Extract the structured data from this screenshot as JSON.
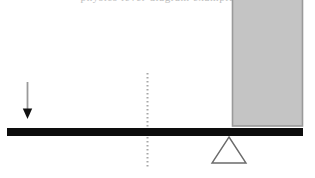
{
  "figure": {
    "background_color": "#ffffff",
    "width": 315,
    "height": 178,
    "clipped_caption_text": "physics lever diagram example"
  },
  "elements": {
    "load_block": {
      "name": "Load block",
      "fill_color": "#c4c4c4",
      "stroke_color": "#9a9a9a",
      "x": 232,
      "y": 0,
      "width": 71,
      "height": 126
    },
    "lever_beam": {
      "name": "Lever beam",
      "color": "#0d0d0d",
      "x": 7,
      "y": 128,
      "width": 296,
      "height": 8
    },
    "fulcrum": {
      "name": "Fulcrum",
      "stroke_color": "#6b6b6b",
      "apex_x": 229,
      "apex_y": 137,
      "base_left_x": 212,
      "base_right_x": 246,
      "base_y": 163
    },
    "force_arrow": {
      "name": "Applied force arrow",
      "direction": "down",
      "shaft_color": "#9a9a9a",
      "head_color": "#111111",
      "x": 27,
      "tail_y": 82,
      "tip_y": 119,
      "head_width": 9,
      "head_height": 9
    },
    "reference_line": {
      "name": "Dotted reference line",
      "color": "#a8a8a8",
      "style": "dotted",
      "x": 147,
      "top_y": 73,
      "bottom_y": 168
    }
  }
}
